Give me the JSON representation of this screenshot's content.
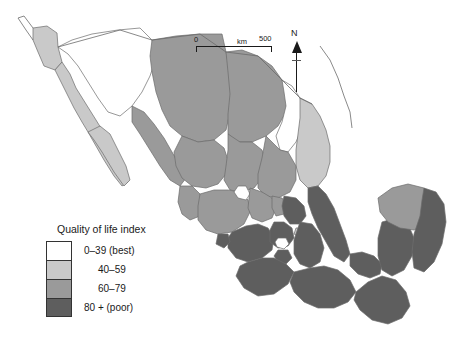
{
  "map": {
    "title": "Quality of life index",
    "region": "Mexico",
    "projection_note": "",
    "classes": [
      {
        "label": "0–39 (best)",
        "color": "#ffffff",
        "range_min": 0,
        "range_max": 39
      },
      {
        "label": "40–59",
        "color": "#c9c9c9",
        "range_min": 40,
        "range_max": 59
      },
      {
        "label": "60–79",
        "color": "#9a9a9a",
        "range_min": 60,
        "range_max": 79
      },
      {
        "label": "80 + (poor)",
        "color": "#5e5e5e",
        "range_min": 80,
        "range_max": 100
      }
    ],
    "scalebar": {
      "zero": "0",
      "unit": "km",
      "max": "500"
    },
    "compass": {
      "north": "N"
    },
    "border_color": "#6b6b6b",
    "ocean_color": "#ffffff"
  }
}
